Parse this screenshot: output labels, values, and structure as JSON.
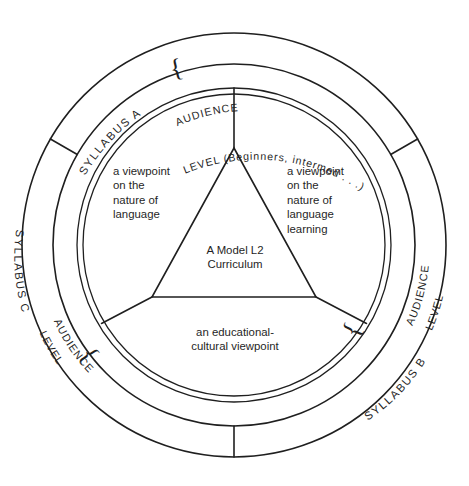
{
  "diagram": {
    "title": "A Model L2 Curriculum",
    "type": "concentric-ring-triangle-diagram",
    "center_label": "A Model L2\nCurriculum",
    "inner_segments": [
      {
        "id": "language-viewpoint",
        "position": "upper-left",
        "text": "a viewpoint\non the\nnature of\nlanguage"
      },
      {
        "id": "language-learning-viewpoint",
        "position": "upper-right",
        "text": "a viewpoint\non the\nnature of\nlanguage\nlearning"
      },
      {
        "id": "educational-cultural-viewpoint",
        "position": "bottom",
        "text": "an educational-\ncultural viewpoint"
      }
    ],
    "ring_segments": [
      {
        "id": "syllabus-a",
        "position": "top",
        "syllabus_label": "SYLLABUS  A",
        "brace": "{",
        "audience_line": "AUDIENCE",
        "level_line": "LEVEL (Beginners, intermed . . .)"
      },
      {
        "id": "syllabus-b",
        "position": "bottom-right",
        "syllabus_label": "SYLLABUS  B",
        "brace": "{",
        "audience_line": "AUDIENCE",
        "level_line": "LEVEL"
      },
      {
        "id": "syllabus-c",
        "position": "bottom-left",
        "syllabus_label": "SYLLABUS  C",
        "brace": "{",
        "audience_line": "AUDIENCE",
        "level_line": "LEVEL"
      }
    ],
    "colors": {
      "stroke": "#1f1f1f",
      "background": "#ffffff",
      "text": "#1f1f1f"
    }
  }
}
